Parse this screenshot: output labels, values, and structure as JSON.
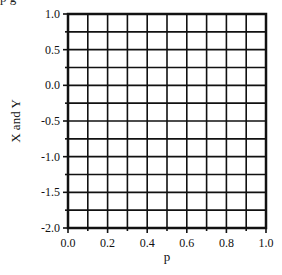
{
  "caption_clipped": "p                                                    g",
  "chart_data": {
    "type": "line",
    "title": "",
    "xlabel": "p",
    "ylabel": "X and Y",
    "xlim": [
      0.0,
      1.0
    ],
    "ylim": [
      -2.0,
      1.0
    ],
    "x_ticks": [
      "0.0",
      "0.2",
      "0.4",
      "0.6",
      "0.8",
      "1.0"
    ],
    "y_ticks": [
      "1.0",
      "0.5",
      "0.0",
      "-0.5",
      "-1.0",
      "-1.5",
      "-2.0"
    ],
    "x_grid_step": 0.1,
    "y_grid_step": 0.25,
    "grid": true,
    "series": [],
    "legend": null
  },
  "style": {
    "frame_color": "#111111",
    "grid_color": "#111111",
    "background": "#ffffff"
  }
}
